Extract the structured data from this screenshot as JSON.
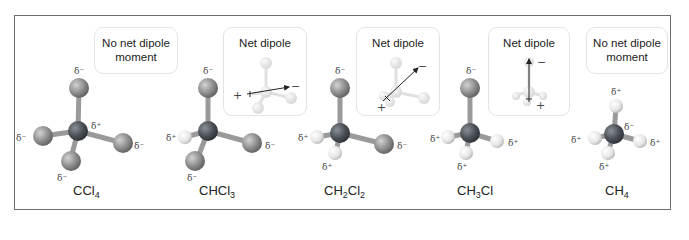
{
  "figure": {
    "colors": {
      "frame_border": "#6e6e6e",
      "callout_border": "#e3e3e3",
      "carbon": "#4a4f55",
      "chlorine": "#8c8c8c",
      "hydrogen": "#e6e6e6",
      "bond": "#9a9a9a"
    },
    "molecules": [
      {
        "id": "ccl4",
        "formula_parts": [
          "CCl",
          "4",
          ""
        ],
        "callout": {
          "line1": "No net dipole",
          "line2": "moment",
          "has_dipole": false
        },
        "charges": {
          "top": "δ⁻",
          "center": "δ⁺",
          "left": "δ⁻",
          "right": "δ⁻",
          "bottom": "δ⁻"
        }
      },
      {
        "id": "chcl3",
        "formula_parts": [
          "CHCl",
          "3",
          ""
        ],
        "callout": {
          "line1": "Net dipole",
          "line2": "",
          "has_dipole": true,
          "arrow_direction": "horizontal",
          "plus": "+",
          "minus": "−"
        },
        "charges": {
          "top": "δ⁻",
          "left": "δ⁺",
          "right": "δ⁻",
          "bottom": "δ⁻"
        }
      },
      {
        "id": "ch2cl2",
        "formula_parts": [
          "CH",
          "2",
          "Cl",
          "2"
        ],
        "callout": {
          "line1": "Net dipole",
          "line2": "",
          "has_dipole": true,
          "arrow_direction": "diagonal",
          "plus": "+",
          "minus": "−"
        },
        "charges": {
          "top": "δ⁻",
          "left": "δ⁺",
          "right": "δ⁻",
          "bottom": "δ⁺"
        }
      },
      {
        "id": "ch3cl",
        "formula_parts": [
          "CH",
          "3",
          "Cl",
          ""
        ],
        "callout": {
          "line1": "Net dipole",
          "line2": "",
          "has_dipole": true,
          "arrow_direction": "vertical",
          "plus": "+",
          "minus": "−"
        },
        "charges": {
          "top": "δ⁻",
          "left": "δ⁺",
          "right": "δ⁺",
          "bottom": "δ⁺"
        }
      },
      {
        "id": "ch4",
        "formula_parts": [
          "CH",
          "4",
          ""
        ],
        "callout": {
          "line1": "No net dipole",
          "line2": "moment",
          "has_dipole": false
        },
        "charges": {
          "top": "δ⁺",
          "center": "δ⁻",
          "left": "δ⁺",
          "right": "δ⁺",
          "bottom": "δ⁺"
        }
      }
    ]
  }
}
